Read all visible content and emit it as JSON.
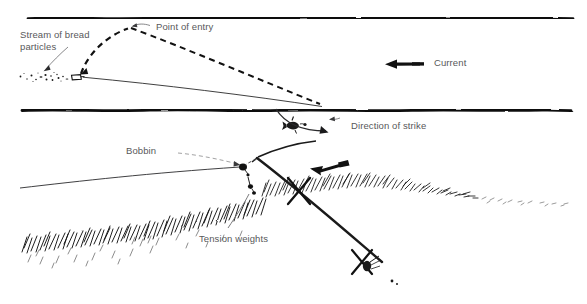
{
  "figure": {
    "background_color": "#ffffff",
    "ink_color": "#111111",
    "label_color": "#58585a",
    "width": 587,
    "height": 304
  },
  "labels": {
    "stream_of_bread_particles": "Stream of bread\nparticles",
    "point_of_entry": "Point of entry",
    "current": "Current",
    "direction_of_strike": "Direction of strike",
    "bobbin": "Bobbin",
    "tension_weights": "Tension weights"
  },
  "upper_panel": {
    "name": "plan-view-of-swim",
    "near_bank_line_y": 18,
    "far_bank_line_y": 110,
    "current_direction": "left",
    "elements": [
      "near-bank-line",
      "far-bank-line",
      "bread-particle-dots",
      "float-marker",
      "line-taut",
      "dashed-cast-arc",
      "dashed-line-drift",
      "current-arrow",
      "hooked-fish",
      "strike-arrow"
    ]
  },
  "lower_panel": {
    "name": "bank-side-view",
    "elements": [
      "rod",
      "rod-rest-front",
      "rod-rest-rear",
      "bobbin-indicator",
      "tension-weight-line",
      "reed-bed-near",
      "reed-bed-far",
      "strike-arrow",
      "fishing-line",
      "dashed-line-to-bobbin"
    ]
  },
  "icons": {
    "current_arrow": "arrow-left-icon",
    "strike_arrow_upper": "curved-arrow-icon",
    "strike_arrow_lower": "arrow-left-icon",
    "pointer_stream": "leader-arrow-icon",
    "pointer_entry": "leader-arrow-icon",
    "pointer_bobbin": "leader-line-icon",
    "pointer_tension": "leader-line-icon"
  }
}
